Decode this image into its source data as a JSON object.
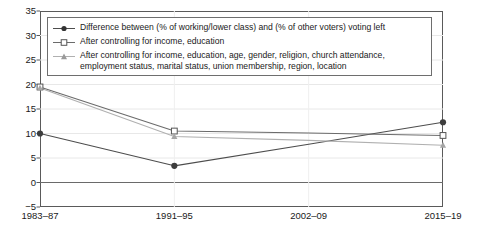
{
  "chart_data": {
    "type": "line",
    "title": "",
    "subtitle": "",
    "xlabel": "",
    "ylabel": "",
    "categories": [
      "1983–87",
      "1991–95",
      "2002–09",
      "2015–19"
    ],
    "xtick_labels": [
      "1983–87",
      "1991–95",
      "2002–09",
      "2015–19"
    ],
    "ytick_labels": [
      "35",
      "30",
      "25",
      "20",
      "15",
      "10",
      "5",
      "0",
      "−5"
    ],
    "ylim": [
      -5,
      35
    ],
    "ytick_step": 5,
    "grid": "horizontal-light",
    "zero_line": true,
    "legend_position": "top-inside",
    "series": [
      {
        "name": "Difference between (% of working/lower class) and (% of other voters) voting left",
        "marker": "filled-circle",
        "color": "#4d4d4d",
        "values": [
          10.0,
          3.4,
          7.8,
          12.3
        ],
        "marker_at": [
          true,
          true,
          false,
          true
        ]
      },
      {
        "name": "After controlling for income, education",
        "marker": "open-square",
        "color": "#6b6b6b",
        "values": [
          19.5,
          10.5,
          10.1,
          9.6
        ],
        "marker_at": [
          true,
          true,
          false,
          true
        ]
      },
      {
        "name": "After controlling for income, education, age, gender, religion, church attendance, employment status, marital status, union membership, region, location",
        "marker": "filled-triangle",
        "color": "#b0b0b0",
        "values": [
          19.3,
          9.4,
          8.6,
          7.6
        ],
        "marker_at": [
          true,
          true,
          false,
          true
        ]
      }
    ]
  },
  "legend": {
    "entries": [
      {
        "label": "Difference between (% of working/lower class) and (% of other voters) voting left",
        "marker": "filled-circle"
      },
      {
        "label": "After controlling for income, education",
        "marker": "open-square"
      },
      {
        "label": "After controlling for income, education, age, gender, religion, church attendance, employment status, marital status, union membership, region, location",
        "marker": "filled-triangle"
      }
    ]
  },
  "colors": {
    "series1": "#4d4d4d",
    "series2": "#6b6b6b",
    "series3": "#b0b0b0",
    "axis": "#5a5a5a",
    "grid": "#e8e8e8",
    "zero_line": "#6a6a6a",
    "background": "#ffffff"
  }
}
